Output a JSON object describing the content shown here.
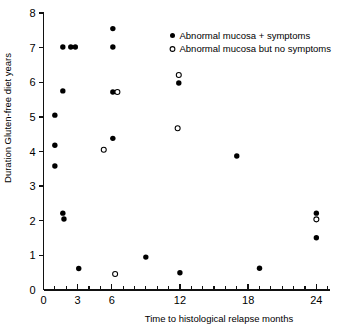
{
  "chart_data": {
    "type": "scatter",
    "title": "",
    "xlabel": "Time to histological relapse months",
    "ylabel": "Duration Gluten-free diet years",
    "xlim": [
      0,
      25.2
    ],
    "ylim": [
      0,
      8
    ],
    "grid": false,
    "legend_position": "top-right",
    "x_ticks_major": [
      0,
      3,
      6,
      12,
      18,
      24
    ],
    "x_tick_labels": [
      "0",
      "3",
      "6",
      "12",
      "18",
      "24"
    ],
    "x_ticks_minor_step": 1,
    "y_ticks": [
      0,
      1,
      2,
      3,
      4,
      5,
      6,
      7,
      8
    ],
    "y_tick_labels": [
      "0",
      "1",
      "2",
      "3",
      "4",
      "5",
      "6",
      "7",
      "8"
    ],
    "series": [
      {
        "name": "Abnormal mucosa + symptoms",
        "marker": "filled-circle",
        "color": "#000000",
        "points": [
          [
            1.0,
            5.05
          ],
          [
            1.0,
            4.18
          ],
          [
            1.0,
            3.58
          ],
          [
            1.7,
            7.02
          ],
          [
            1.7,
            5.75
          ],
          [
            1.7,
            2.22
          ],
          [
            1.8,
            2.05
          ],
          [
            2.4,
            7.02
          ],
          [
            2.8,
            7.02
          ],
          [
            3.1,
            0.62
          ],
          [
            6.1,
            7.55
          ],
          [
            6.1,
            7.02
          ],
          [
            6.1,
            5.72
          ],
          [
            6.1,
            4.38
          ],
          [
            9.0,
            0.95
          ],
          [
            11.9,
            5.98
          ],
          [
            12.0,
            0.5
          ],
          [
            17.0,
            3.87
          ],
          [
            19.0,
            0.63
          ],
          [
            24.0,
            2.22
          ],
          [
            24.0,
            1.51
          ]
        ]
      },
      {
        "name": "Abnormal mucosa but no symptoms",
        "marker": "open-circle",
        "color": "#000000",
        "points": [
          [
            5.3,
            4.05
          ],
          [
            6.3,
            0.46
          ],
          [
            6.5,
            5.72
          ],
          [
            11.9,
            6.21
          ],
          [
            11.8,
            4.67
          ],
          [
            24.0,
            2.04
          ]
        ]
      }
    ]
  },
  "legend": {
    "entries": [
      {
        "label": "Abnormal mucosa + symptoms",
        "marker": "filled-circle"
      },
      {
        "label": "Abnormal mucosa but no symptoms",
        "marker": "open-circle"
      }
    ]
  }
}
